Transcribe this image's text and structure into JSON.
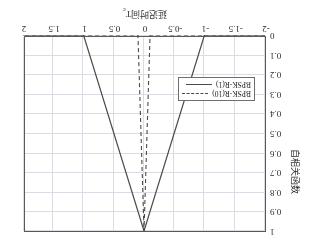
{
  "chart_data": {
    "type": "line",
    "title": "",
    "xlabel": "延迟时间Tc",
    "xlabel_main": "延迟时间T",
    "xlabel_sub": "c",
    "ylabel": "自相关函数",
    "xlim": [
      -2,
      2
    ],
    "ylim": [
      0,
      1
    ],
    "xticks": [
      "-2",
      "-1.5",
      "-1",
      "-0.5",
      "0",
      "0.5",
      "1",
      "1.5",
      "2"
    ],
    "xtick_values": [
      -2,
      -1.5,
      -1,
      -0.5,
      0,
      0.5,
      1,
      1.5,
      2
    ],
    "yticks": [
      "0",
      "0.1",
      "0.2",
      "0.3",
      "0.4",
      "0.5",
      "0.6",
      "0.7",
      "0.8",
      "0.9",
      "1"
    ],
    "ytick_values": [
      0,
      0.1,
      0.2,
      0.3,
      0.4,
      0.5,
      0.6,
      0.7,
      0.8,
      0.9,
      1
    ],
    "grid": true,
    "legend_position": "lower left",
    "rotation_degrees": 180,
    "series": [
      {
        "name": "BPSK-R(1)",
        "style": "solid",
        "color": "#4a4a4a",
        "x": [
          -2,
          -1,
          0,
          1,
          2
        ],
        "values": [
          0,
          0,
          1,
          0,
          0
        ]
      },
      {
        "name": "BPSK-R(10)",
        "style": "dashed",
        "color": "#4a4a4a",
        "x": [
          -2,
          -0.1,
          0,
          0.1,
          2
        ],
        "values": [
          0,
          0,
          1,
          0,
          0
        ]
      }
    ]
  },
  "legend": {
    "entries": [
      {
        "label": "BPSK-R(10)",
        "style": "dashed"
      },
      {
        "label": "BPSK-R(1)",
        "style": "solid"
      }
    ]
  }
}
